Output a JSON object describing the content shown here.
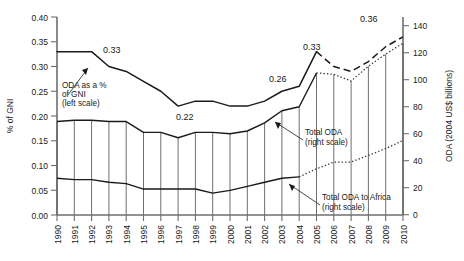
{
  "chart_data": {
    "type": "line",
    "title": "",
    "subtitle": "",
    "xlabel": "",
    "ylabel": "% of GNI",
    "y2label": "ODA (2004 US$ billions)",
    "grid": false,
    "legend_position": "none",
    "x": [
      1990,
      1991,
      1992,
      1993,
      1994,
      1995,
      1996,
      1997,
      1998,
      1999,
      2000,
      2001,
      2002,
      2003,
      2004,
      2005,
      2006,
      2007,
      2008,
      2009,
      2010
    ],
    "categories": [
      "1990",
      "1991",
      "1992",
      "1993",
      "1994",
      "1995",
      "1996",
      "1997",
      "1998",
      "1999",
      "2000",
      "2001",
      "2002",
      "2003",
      "2004",
      "2005",
      "2006",
      "2007",
      "2008",
      "2009",
      "2010"
    ],
    "ylim": [
      0.0,
      0.4
    ],
    "yticks": [
      "0.00",
      "0.05",
      "0.10",
      "0.15",
      "0.20",
      "0.25",
      "0.30",
      "0.35",
      "0.40"
    ],
    "ytick_values": [
      0.0,
      0.05,
      0.1,
      0.15,
      0.2,
      0.25,
      0.3,
      0.35,
      0.4
    ],
    "y2lim": [
      0,
      140
    ],
    "y2ticks": [
      "0",
      "20",
      "40",
      "60",
      "80",
      "100",
      "120",
      "140"
    ],
    "y2tick_values": [
      0,
      20,
      40,
      60,
      80,
      100,
      120,
      140
    ],
    "series": [
      {
        "name": "ODA as a % of GNI",
        "scale": "left",
        "style": "solid",
        "segment": "actual",
        "x": [
          1990,
          1991,
          1992,
          1993,
          1994,
          1995,
          1996,
          1997,
          1998,
          1999,
          2000,
          2001,
          2002,
          2003,
          2004,
          2005
        ],
        "values": [
          0.33,
          0.33,
          0.33,
          0.3,
          0.29,
          0.27,
          0.25,
          0.22,
          0.23,
          0.23,
          0.22,
          0.22,
          0.23,
          0.25,
          0.26,
          0.33
        ]
      },
      {
        "name": "ODA as a % of GNI (projected)",
        "scale": "left",
        "style": "dashed",
        "segment": "projection",
        "x": [
          2005,
          2006,
          2007,
          2008,
          2009,
          2010
        ],
        "values": [
          0.33,
          0.3,
          0.29,
          0.31,
          0.34,
          0.36
        ]
      },
      {
        "name": "Total ODA",
        "scale": "right",
        "style": "solid",
        "segment": "actual",
        "x": [
          1990,
          1991,
          1992,
          1993,
          1994,
          1995,
          1996,
          1997,
          1998,
          1999,
          2000,
          2001,
          2002,
          2003,
          2004,
          2005
        ],
        "values": [
          69,
          70,
          70,
          69,
          69,
          61,
          61,
          57,
          61,
          61,
          60,
          62,
          68,
          77,
          80,
          105
        ]
      },
      {
        "name": "Total ODA (projected)",
        "scale": "right",
        "style": "dotted",
        "segment": "projection",
        "x": [
          2005,
          2006,
          2007,
          2008,
          2009,
          2010
        ],
        "values": [
          105,
          104,
          99,
          110,
          119,
          127
        ]
      },
      {
        "name": "Total ODA to Africa",
        "scale": "right",
        "style": "solid",
        "segment": "actual",
        "x": [
          1990,
          1991,
          1992,
          1993,
          1994,
          1995,
          1996,
          1997,
          1998,
          1999,
          2000,
          2001,
          2002,
          2003,
          2004
        ],
        "values": [
          27,
          26,
          26,
          24,
          23,
          19,
          19,
          19,
          19,
          16,
          18,
          21,
          24,
          27,
          28
        ]
      },
      {
        "name": "Total ODA to Africa (projected)",
        "scale": "right",
        "style": "dotted",
        "segment": "projection",
        "x": [
          2004,
          2005,
          2006,
          2007,
          2008,
          2009,
          2010
        ],
        "values": [
          28,
          34,
          39,
          39,
          44,
          49,
          55
        ]
      }
    ],
    "data_labels": [
      {
        "text": "0.33",
        "x_year": 1992,
        "value": 0.33,
        "series": "ODA as a % of GNI"
      },
      {
        "text": "0.22",
        "x_year": 1998,
        "value": 0.22,
        "series": "ODA as a % of GNI"
      },
      {
        "text": "0.26",
        "x_year": 2004,
        "value": 0.26,
        "series": "ODA as a % of GNI"
      },
      {
        "text": "0.33",
        "x_year": 2005,
        "value": 0.33,
        "series": "ODA as a % of GNI"
      },
      {
        "text": "0.36",
        "x_year": 2010,
        "value": 0.36,
        "series": "ODA as a % of GNI (projected)"
      }
    ],
    "annotations": [
      {
        "id": "annot-oda-gni",
        "line1": "ODA as a % ",
        "line2": "of GNI",
        "line3": "(left scale)",
        "points_to_year": 1992
      },
      {
        "id": "annot-total-oda",
        "line1": "Total ODA",
        "line2": "(right scale)",
        "line3": "",
        "points_to_year": 2004
      },
      {
        "id": "annot-total-oda-africa",
        "line1": "Total ODA to Africa",
        "line2": "(right scale)",
        "line3": "",
        "points_to_year": 2004
      }
    ]
  },
  "colors": {
    "line": "#1a1a1a",
    "axis": "#6e6e6e",
    "hatch": "#555555",
    "background": "#ffffff"
  }
}
